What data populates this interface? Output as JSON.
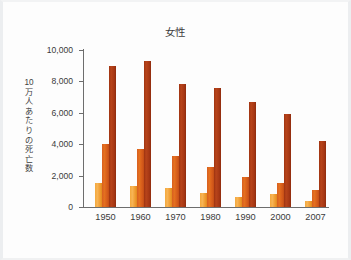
{
  "chart_data": {
    "type": "bar",
    "title": "女性",
    "xlabel": "",
    "ylabel": "10万人あたりの死亡数",
    "categories": [
      "1950",
      "1960",
      "1970",
      "1980",
      "1990",
      "2000",
      "2007"
    ],
    "ytick_labels": [
      "10,000",
      "8,000",
      "6,000",
      "4,000",
      "2,000",
      "0"
    ],
    "ytick_values": [
      10000,
      8000,
      6000,
      4000,
      2000,
      0
    ],
    "ylim": [
      0,
      10000
    ],
    "grid": false,
    "legend": "none",
    "series": [
      {
        "name": "series-1",
        "color": "#f4a93d",
        "values": [
          1500,
          1350,
          1200,
          900,
          650,
          800,
          400
        ]
      },
      {
        "name": "series-2",
        "color": "#d85f20",
        "values": [
          4000,
          3700,
          3250,
          2550,
          1900,
          1500,
          1100
        ]
      },
      {
        "name": "series-3",
        "color": "#9e3311",
        "values": [
          9000,
          9300,
          7850,
          7550,
          6700,
          5900,
          4200
        ]
      }
    ]
  }
}
